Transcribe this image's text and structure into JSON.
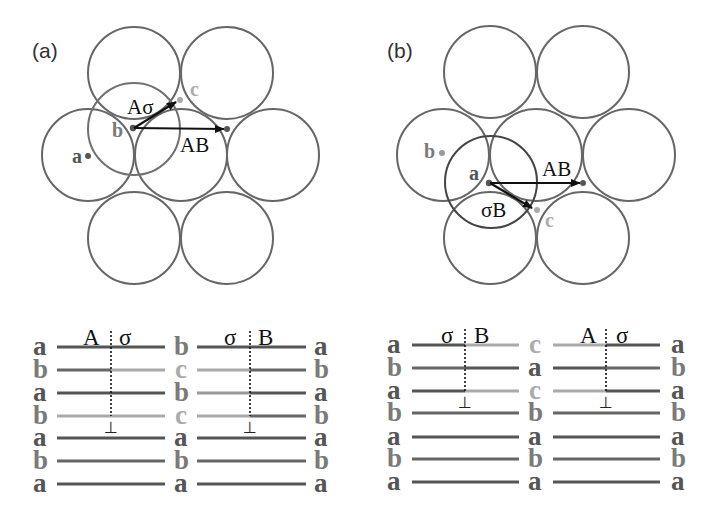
{
  "colors": {
    "a": "#555555",
    "b": "#7a7a7a",
    "c": "#ababab",
    "circle": "#666666",
    "overlay_a": "#707070",
    "overlay_b": "#444444",
    "arrow": "#111111"
  },
  "panels": [
    {
      "label": "(a)",
      "points": [
        {
          "name": "a"
        },
        {
          "name": "b"
        },
        {
          "name": "c"
        }
      ],
      "vectors": [
        {
          "label": "Aσ"
        },
        {
          "label": "AB"
        }
      ],
      "stacking": {
        "headers": [
          {
            "left": "A",
            "right": "σ"
          },
          {
            "left": "σ",
            "right": "B"
          }
        ],
        "col1": [
          "a",
          "b",
          "a",
          "b",
          "a",
          "b",
          "a"
        ],
        "col2": [
          "b",
          "c",
          "b",
          "c",
          "a",
          "b",
          "a"
        ],
        "col3": [
          "a",
          "b",
          "a",
          "b",
          "a",
          "b",
          "a"
        ],
        "dislocation_symbol": "⊥"
      }
    },
    {
      "label": "(b)",
      "points": [
        {
          "name": "a"
        },
        {
          "name": "b"
        },
        {
          "name": "c"
        }
      ],
      "vectors": [
        {
          "label": "AB"
        },
        {
          "label": "σB"
        }
      ],
      "stacking": {
        "headers": [
          {
            "left": "σ",
            "right": "B"
          },
          {
            "left": "A",
            "right": "σ"
          }
        ],
        "col1": [
          "a",
          "b",
          "a",
          "b",
          "a",
          "b",
          "a"
        ],
        "col2": [
          "c",
          "a",
          "c",
          "b",
          "a",
          "b",
          "a"
        ],
        "col3": [
          "a",
          "b",
          "a",
          "b",
          "a",
          "b",
          "a"
        ],
        "dislocation_symbol": "⊥"
      }
    }
  ]
}
